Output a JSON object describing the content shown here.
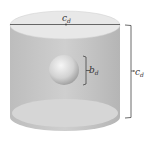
{
  "diagram": {
    "title": "",
    "shapes": {
      "cylinder": {
        "description": "transparent gray cylinder"
      },
      "sphere": {
        "description": "sphere inside cylinder"
      }
    },
    "labels": {
      "top_diameter": {
        "main": "c",
        "sub": "d"
      },
      "sphere_diameter": {
        "main": "b",
        "sub": "d"
      },
      "cylinder_height": {
        "main": "c",
        "sub": "d"
      }
    },
    "colors": {
      "cylinder_body": "#c8c8c8",
      "cylinder_top": "#e6e6e6",
      "line": "#444444",
      "sphere_light": "#f4f4f4",
      "sphere_dark": "#9a9a9a"
    }
  }
}
